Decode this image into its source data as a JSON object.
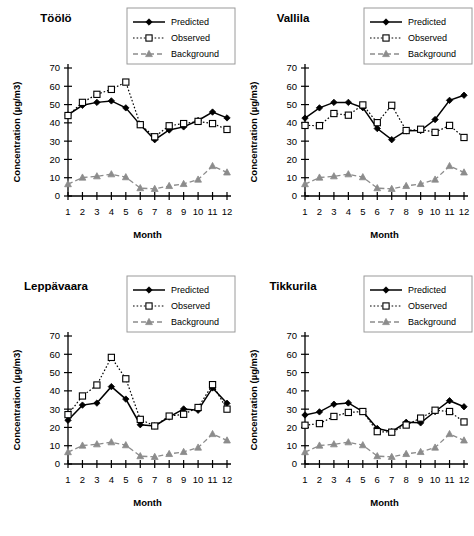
{
  "figure": {
    "axis": {
      "ylabel": "Concentration  (µg/m3)",
      "xlabel": "Month",
      "yticks": [
        "0",
        "10",
        "20",
        "30",
        "40",
        "50",
        "60",
        "70"
      ],
      "xticks": [
        "1",
        "2",
        "3",
        "4",
        "5",
        "6",
        "7",
        "8",
        "9",
        "10",
        "11",
        "12"
      ]
    },
    "legend": {
      "predicted": "Predicted",
      "observed": "Observed",
      "background": "Background"
    },
    "colors": {
      "predicted": "#000000",
      "observed": "#000000",
      "background": "#8c8c8c",
      "axis": "#000000",
      "legend_border": "#9a9a9a"
    }
  },
  "chart_data": [
    {
      "type": "line",
      "title": "Töölö",
      "xlabel": "Month",
      "ylabel": "Concentration  (µg/m3)",
      "x": [
        1,
        2,
        3,
        4,
        5,
        6,
        7,
        8,
        9,
        10,
        11,
        12
      ],
      "categories": [
        "1",
        "2",
        "3",
        "4",
        "5",
        "6",
        "7",
        "8",
        "9",
        "10",
        "11",
        "12"
      ],
      "ylim": [
        0,
        70
      ],
      "grid": false,
      "legend_position": "top-right",
      "series": [
        {
          "name": "Predicted",
          "values": [
            44.3,
            49.6,
            51.2,
            52.0,
            48.2,
            38.9,
            30.8,
            36.1,
            37.8,
            41.3,
            45.9,
            42.7
          ]
        },
        {
          "name": "Observed",
          "values": [
            44.0,
            51.2,
            55.6,
            58.3,
            62.3,
            39.0,
            32.4,
            38.4,
            39.6,
            40.8,
            39.6,
            36.4
          ]
        },
        {
          "name": "Background",
          "values": [
            6.5,
            10.1,
            10.8,
            11.9,
            10.3,
            4.3,
            3.9,
            5.5,
            6.6,
            9.0,
            16.4,
            12.9
          ]
        }
      ]
    },
    {
      "type": "line",
      "title": "Vallila",
      "xlabel": "Month",
      "ylabel": "Concentration  (µg/m3)",
      "x": [
        1,
        2,
        3,
        4,
        5,
        6,
        7,
        8,
        9,
        10,
        11,
        12
      ],
      "categories": [
        "1",
        "2",
        "3",
        "4",
        "5",
        "6",
        "7",
        "8",
        "9",
        "10",
        "11",
        "12"
      ],
      "ylim": [
        0,
        70
      ],
      "grid": false,
      "legend_position": "top-right",
      "series": [
        {
          "name": "Predicted",
          "values": [
            42.6,
            48.2,
            51.2,
            51.2,
            48.3,
            36.9,
            30.8,
            35.7,
            35.8,
            41.8,
            52.3,
            55.1
          ]
        },
        {
          "name": "Observed",
          "values": [
            38.6,
            38.5,
            45.1,
            44.2,
            49.8,
            40.1,
            49.6,
            35.8,
            36.5,
            34.8,
            38.6,
            32.0
          ]
        },
        {
          "name": "Background",
          "values": [
            6.5,
            10.1,
            10.8,
            11.9,
            10.3,
            4.3,
            3.9,
            5.5,
            6.6,
            9.0,
            16.4,
            12.9
          ]
        }
      ]
    },
    {
      "type": "line",
      "title": "Leppävaara",
      "xlabel": "Month",
      "ylabel": "Concentration  (µg/m3)",
      "x": [
        1,
        2,
        3,
        4,
        5,
        6,
        7,
        8,
        9,
        10,
        11,
        12
      ],
      "categories": [
        "1",
        "2",
        "3",
        "4",
        "5",
        "6",
        "7",
        "8",
        "9",
        "10",
        "11",
        "12"
      ],
      "ylim": [
        0,
        70
      ],
      "grid": false,
      "legend_position": "top-right",
      "series": [
        {
          "name": "Predicted",
          "values": [
            23.9,
            32.2,
            33.3,
            42.3,
            35.5,
            21.5,
            20.8,
            25.7,
            30.1,
            29.4,
            41.6,
            33.2
          ]
        },
        {
          "name": "Observed",
          "values": [
            27.0,
            37.2,
            43.2,
            58.3,
            46.6,
            24.4,
            20.8,
            26.2,
            27.2,
            30.9,
            43.4,
            30.0
          ]
        },
        {
          "name": "Background",
          "values": [
            6.5,
            10.1,
            10.8,
            11.9,
            10.3,
            4.3,
            3.9,
            5.5,
            6.6,
            9.0,
            16.4,
            12.9
          ]
        }
      ]
    },
    {
      "type": "line",
      "title": "Tikkurila",
      "xlabel": "Month",
      "ylabel": "Concentration  (µg/m3)",
      "x": [
        1,
        2,
        3,
        4,
        5,
        6,
        7,
        8,
        9,
        10,
        11,
        12
      ],
      "categories": [
        "1",
        "2",
        "3",
        "4",
        "5",
        "6",
        "7",
        "8",
        "9",
        "10",
        "11",
        "12"
      ],
      "ylim": [
        0,
        70
      ],
      "grid": false,
      "legend_position": "top-right",
      "series": [
        {
          "name": "Predicted",
          "values": [
            26.8,
            28.5,
            32.7,
            33.4,
            28.7,
            19.4,
            17.7,
            22.8,
            22.5,
            28.7,
            34.6,
            31.3
          ]
        },
        {
          "name": "Observed",
          "values": [
            21.2,
            22.1,
            26.0,
            28.2,
            28.7,
            17.7,
            17.4,
            21.3,
            25.1,
            29.4,
            28.7,
            23.0
          ]
        },
        {
          "name": "Background",
          "values": [
            6.5,
            10.1,
            10.8,
            11.9,
            10.3,
            4.3,
            3.9,
            5.5,
            6.6,
            9.0,
            16.4,
            12.9
          ]
        }
      ]
    }
  ]
}
